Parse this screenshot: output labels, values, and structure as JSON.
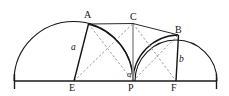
{
  "figure": {
    "kind": "geometry-diagram",
    "width": 229,
    "height": 96,
    "background_color": "#ffffff",
    "stroke_color": "#141414",
    "dashed_color": "#8d8d8d",
    "axis_color": "#1a1a1a"
  },
  "labels": {
    "point_a": "A",
    "point_b": "B",
    "point_c": "C",
    "point_e": "E",
    "point_f": "F",
    "point_p": "P",
    "side_a": "a",
    "side_b": "b",
    "angle_at_p": "α",
    "angle_at_a": "α"
  },
  "geometry": {
    "baseline": {
      "y": 81,
      "x_start": 14,
      "x_end": 217
    },
    "points": {
      "A": {
        "x": 88.5,
        "y": 24
      },
      "B": {
        "x": 178,
        "y": 35
      },
      "C": {
        "x": 133,
        "y": 23.5
      },
      "E": {
        "x": 74,
        "y": 81
      },
      "F": {
        "x": 176,
        "y": 81
      },
      "P": {
        "x": 133,
        "y": 81
      }
    },
    "arcs": [
      {
        "name": "big-left-semicircle",
        "cx": 73.5,
        "cy": 81,
        "r": 59.5,
        "note": "spans baseline x=14 to x=133"
      },
      {
        "name": "mid-semicircle",
        "cx": 133,
        "cy": 81,
        "r": 44.5,
        "note": "through A down to P region"
      },
      {
        "name": "right-semicircle",
        "cx": 176,
        "cy": 81,
        "r": 41,
        "note": "spans baseline x=135 to x=217"
      },
      {
        "name": "small-right-arc",
        "cx": 155,
        "cy": 81,
        "r": 23,
        "note": "P to F arc through B side"
      }
    ],
    "solid_segments": [
      {
        "from": "A",
        "to": "C"
      },
      {
        "from": "C",
        "to": "B"
      },
      {
        "from": "A",
        "to": "E"
      },
      {
        "from": "B",
        "to": "F"
      }
    ],
    "gray_segments": [
      {
        "from": "C",
        "to": "P"
      }
    ],
    "dashed_segments": [
      {
        "from": "E",
        "to": "C"
      },
      {
        "from": "A",
        "to": "P"
      },
      {
        "from": "C",
        "to": "F"
      },
      {
        "from": "P",
        "to": "B"
      }
    ],
    "end_ticks": [
      {
        "x": 14,
        "y": 81
      },
      {
        "x": 217,
        "y": 81
      }
    ]
  },
  "label_positions": {
    "A": {
      "x": 84,
      "y": 10
    },
    "C": {
      "x": 130,
      "y": 12
    },
    "B": {
      "x": 175,
      "y": 25
    },
    "E": {
      "x": 69,
      "y": 83
    },
    "P": {
      "x": 128,
      "y": 83
    },
    "F": {
      "x": 171,
      "y": 83
    },
    "side_a": {
      "x": 71,
      "y": 43
    },
    "side_b": {
      "x": 179,
      "y": 55
    },
    "angle_at_p": {
      "x": 127,
      "y": 70
    },
    "angle_at_a": {
      "x": 91,
      "y": 23
    }
  }
}
